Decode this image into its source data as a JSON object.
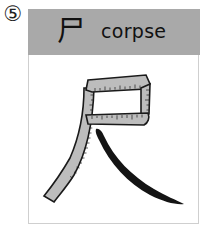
{
  "card": {
    "number": "⑤",
    "kanji": "尸",
    "meaning": "corpse",
    "illustration": {
      "subject": "kanji 尺 drawn as a bent measuring tape",
      "depicted_character": "尺"
    }
  },
  "colors": {
    "header_bg": "#a9a9a9",
    "tape_fill": "#bdbdbd",
    "outline": "#1a1a1a",
    "brush_stroke": "#141414",
    "card_border": "#cfcfcf"
  }
}
